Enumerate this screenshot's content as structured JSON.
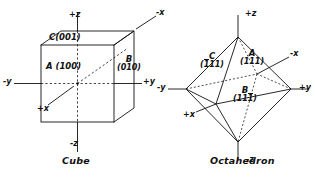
{
  "figure": {
    "panels": [
      {
        "id": "cube",
        "caption": "Cube",
        "faces": [
          {
            "key": "A",
            "letter": "A",
            "index": "(100)",
            "text": "A (100)"
          },
          {
            "key": "B",
            "letter": "B",
            "index": "(010)",
            "text": "B (010)"
          },
          {
            "key": "C",
            "letter": "C",
            "index": "(001)",
            "text": "C(001)"
          }
        ],
        "axes": [
          {
            "key": "pz",
            "label": "+z"
          },
          {
            "key": "nz",
            "label": "-z"
          },
          {
            "key": "py",
            "label": "+y"
          },
          {
            "key": "ny",
            "label": "-y"
          },
          {
            "key": "px",
            "label": "+x"
          },
          {
            "key": "nx",
            "label": "-x"
          }
        ]
      },
      {
        "id": "octahedron",
        "caption": "Octahedron",
        "faces": [
          {
            "key": "A",
            "letter": "A",
            "index": "(111)",
            "bar": "none"
          },
          {
            "key": "B",
            "letter": "B",
            "index": "(111)",
            "bar": "last",
            "digits": [
              "1",
              "1",
              "1"
            ]
          },
          {
            "key": "C",
            "letter": "C",
            "index": "(111)",
            "bar": "first",
            "digits": [
              "1",
              "1",
              "1"
            ]
          }
        ],
        "axes": [
          {
            "key": "pz",
            "label": "+z"
          },
          {
            "key": "nz",
            "label": "-z"
          },
          {
            "key": "py",
            "label": "+y"
          },
          {
            "key": "ny",
            "label": "-y"
          },
          {
            "key": "px",
            "label": "+x"
          },
          {
            "key": "nx",
            "label": "-x"
          }
        ]
      }
    ],
    "colors": {
      "ink": "#111111",
      "paper": "#ffffff"
    }
  }
}
